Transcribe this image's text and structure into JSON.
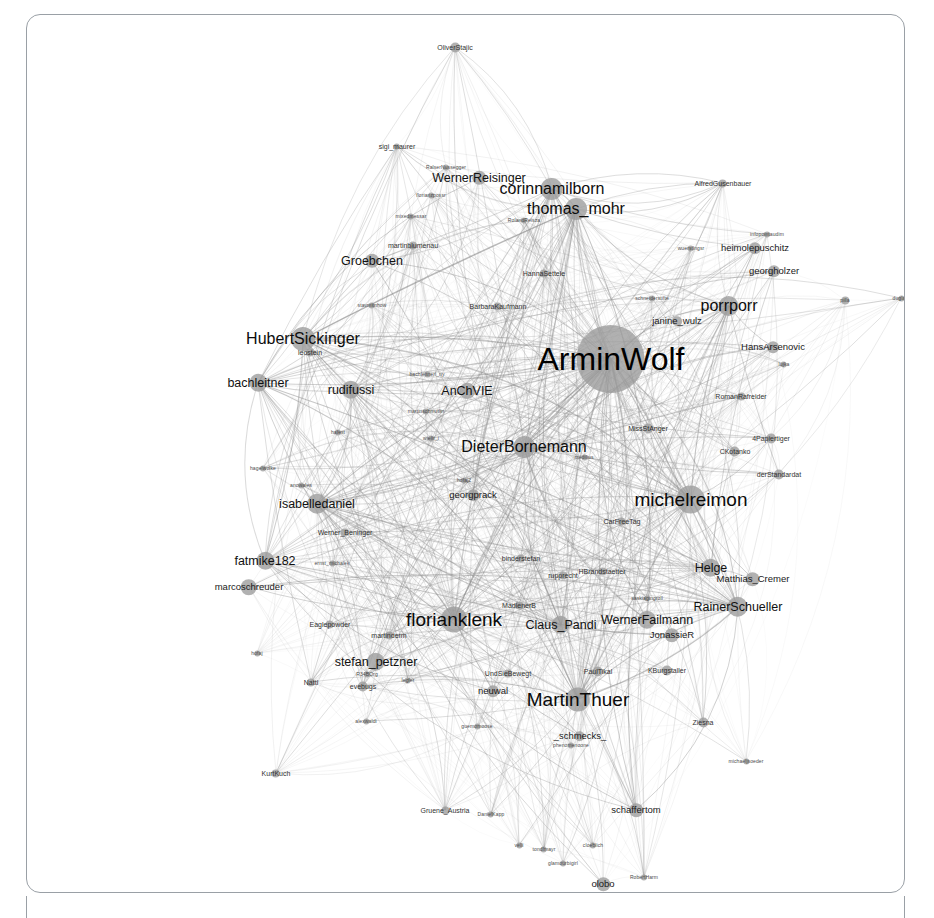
{
  "view": {
    "title": "Twitter mention network graph",
    "background_color": "#ffffff",
    "frame_color": "#9aa0a6",
    "node_color": "#9b9b9b",
    "edge_color": "#8d8d8d",
    "label_color": "#111111"
  },
  "chart_data": {
    "type": "scatter",
    "title": "",
    "xlabel": "",
    "ylabel": "",
    "layout": "force-directed node-link diagram",
    "grid": false,
    "legend": "none",
    "xlim": [
      0,
      877
    ],
    "ylim": [
      0,
      877
    ],
    "nodes": [
      {
        "label": "OliverStajic",
        "x": 428,
        "y": 32,
        "size": 5,
        "tier": "tier-s"
      },
      {
        "label": "sigi_maurer",
        "x": 370,
        "y": 131,
        "size": 3,
        "tier": "tier-s"
      },
      {
        "label": "RalserNussegger",
        "x": 419,
        "y": 152,
        "size": 3,
        "tier": "tier-xs"
      },
      {
        "label": "WernerReisinger",
        "x": 452,
        "y": 163,
        "size": 7,
        "tier": "tier-l"
      },
      {
        "label": "florianzpossr",
        "x": 404,
        "y": 180,
        "size": 3,
        "tier": "tier-xs"
      },
      {
        "label": "corinnamilborn",
        "x": 525,
        "y": 174,
        "size": 11,
        "tier": "tier-xl"
      },
      {
        "label": "thomas_mohr",
        "x": 549,
        "y": 194,
        "size": 11,
        "tier": "tier-xl"
      },
      {
        "label": "mixedmessar",
        "x": 384,
        "y": 201,
        "size": 3,
        "tier": "tier-xs"
      },
      {
        "label": "RolandReisza",
        "x": 497,
        "y": 205,
        "size": 3,
        "tier": "tier-xs"
      },
      {
        "label": "AlfredGusenbauer",
        "x": 696,
        "y": 168,
        "size": 4,
        "tier": "tier-s"
      },
      {
        "label": "martinblumenau",
        "x": 386,
        "y": 230,
        "size": 4,
        "tier": "tier-s"
      },
      {
        "label": "Groebchen",
        "x": 345,
        "y": 246,
        "size": 7,
        "tier": "tier-l"
      },
      {
        "label": "infopointaudim",
        "x": 740,
        "y": 219,
        "size": 3,
        "tier": "tier-xs"
      },
      {
        "label": "heimolepuschitz",
        "x": 728,
        "y": 233,
        "size": 6,
        "tier": "tier-m"
      },
      {
        "label": "georgholzer",
        "x": 747,
        "y": 256,
        "size": 6,
        "tier": "tier-m"
      },
      {
        "label": "wuerstlngsr",
        "x": 664,
        "y": 233,
        "size": 3,
        "tier": "tier-xs"
      },
      {
        "label": "HannaSettele",
        "x": 517,
        "y": 258,
        "size": 4,
        "tier": "tier-s"
      },
      {
        "label": "BarbaraKaufmann",
        "x": 471,
        "y": 291,
        "size": 4,
        "tier": "tier-s"
      },
      {
        "label": "schneiderstifte",
        "x": 625,
        "y": 283,
        "size": 3,
        "tier": "tier-xs"
      },
      {
        "label": "porrporr",
        "x": 702,
        "y": 291,
        "size": 10,
        "tier": "tier-xl"
      },
      {
        "label": "pilla",
        "x": 818,
        "y": 285,
        "size": 4,
        "tier": "tier-xs"
      },
      {
        "label": "duglam",
        "x": 874,
        "y": 283,
        "size": 3,
        "tier": "tier-xs"
      },
      {
        "label": "janine_wulz",
        "x": 650,
        "y": 306,
        "size": 5,
        "tier": "tier-m"
      },
      {
        "label": "ArminWolf",
        "x": 584,
        "y": 344,
        "size": 34,
        "tier": "tier-huge"
      },
      {
        "label": "HansArsenovic",
        "x": 746,
        "y": 332,
        "size": 6,
        "tier": "tier-m"
      },
      {
        "label": "lujka",
        "x": 757,
        "y": 349,
        "size": 3,
        "tier": "tier-xs"
      },
      {
        "label": "stavmitnhow",
        "x": 345,
        "y": 290,
        "size": 3,
        "tier": "tier-xs"
      },
      {
        "label": "HubertSickinger",
        "x": 276,
        "y": 324,
        "size": 12,
        "tier": "tier-xl"
      },
      {
        "label": "leostein",
        "x": 283,
        "y": 337,
        "size": 4,
        "tier": "tier-s"
      },
      {
        "label": "bachleitner",
        "x": 231,
        "y": 368,
        "size": 9,
        "tier": "tier-l"
      },
      {
        "label": "rudifussi",
        "x": 324,
        "y": 375,
        "size": 9,
        "tier": "tier-l"
      },
      {
        "label": "AnChVIE",
        "x": 440,
        "y": 376,
        "size": 8,
        "tier": "tier-l"
      },
      {
        "label": "bachleitneri_ny",
        "x": 400,
        "y": 359,
        "size": 3,
        "tier": "tier-xs"
      },
      {
        "label": "martinschmutlin",
        "x": 399,
        "y": 396,
        "size": 3,
        "tier": "tier-xs"
      },
      {
        "label": "RomanRafreider",
        "x": 714,
        "y": 381,
        "size": 4,
        "tier": "tier-s"
      },
      {
        "label": "MissStAnger",
        "x": 621,
        "y": 413,
        "size": 5,
        "tier": "tier-s"
      },
      {
        "label": "4Papiertiger",
        "x": 744,
        "y": 423,
        "size": 5,
        "tier": "tier-s"
      },
      {
        "label": "CKotanko",
        "x": 708,
        "y": 436,
        "size": 5,
        "tier": "tier-s"
      },
      {
        "label": "DieterBornemann",
        "x": 497,
        "y": 432,
        "size": 11,
        "tier": "tier-xl"
      },
      {
        "label": "medilius",
        "x": 557,
        "y": 442,
        "size": 3,
        "tier": "tier-xs"
      },
      {
        "label": "derStandardat",
        "x": 752,
        "y": 459,
        "size": 5,
        "tier": "tier-s"
      },
      {
        "label": "hafest",
        "x": 311,
        "y": 417,
        "size": 3,
        "tier": "tier-xs"
      },
      {
        "label": "wielir_i",
        "x": 404,
        "y": 423,
        "size": 3,
        "tier": "tier-xs"
      },
      {
        "label": "michelreimon",
        "x": 664,
        "y": 484,
        "size": 14,
        "tier": "tier-xxl"
      },
      {
        "label": "georgprack",
        "x": 446,
        "y": 480,
        "size": 6,
        "tier": "tier-m"
      },
      {
        "label": "hofaj2",
        "x": 437,
        "y": 465,
        "size": 3,
        "tier": "tier-xs"
      },
      {
        "label": "isabelledaniel",
        "x": 290,
        "y": 489,
        "size": 10,
        "tier": "tier-l"
      },
      {
        "label": "CarFreeTag",
        "x": 595,
        "y": 506,
        "size": 4,
        "tier": "tier-s"
      },
      {
        "label": "hagelwolke",
        "x": 236,
        "y": 453,
        "size": 3,
        "tier": "tier-xs"
      },
      {
        "label": "anowales",
        "x": 274,
        "y": 470,
        "size": 3,
        "tier": "tier-xs"
      },
      {
        "label": "Werner_Beninger",
        "x": 318,
        "y": 517,
        "size": 4,
        "tier": "tier-s"
      },
      {
        "label": "binderstefan",
        "x": 494,
        "y": 543,
        "size": 4,
        "tier": "tier-s"
      },
      {
        "label": "HBrandstaetter",
        "x": 575,
        "y": 556,
        "size": 4,
        "tier": "tier-s"
      },
      {
        "label": "rupprecht",
        "x": 536,
        "y": 560,
        "size": 4,
        "tier": "tier-s"
      },
      {
        "label": "fatmike182",
        "x": 238,
        "y": 546,
        "size": 9,
        "tier": "tier-l"
      },
      {
        "label": "ernst_michalek",
        "x": 305,
        "y": 548,
        "size": 3,
        "tier": "tier-xs"
      },
      {
        "label": "marcoschreuder",
        "x": 222,
        "y": 572,
        "size": 8,
        "tier": "tier-m"
      },
      {
        "label": "Helge",
        "x": 684,
        "y": 553,
        "size": 9,
        "tier": "tier-l"
      },
      {
        "label": "Matthias_Cremer",
        "x": 726,
        "y": 564,
        "size": 7,
        "tier": "tier-m"
      },
      {
        "label": "saskiagingroll",
        "x": 620,
        "y": 583,
        "size": 3,
        "tier": "tier-xs"
      },
      {
        "label": "RainerSchueller",
        "x": 711,
        "y": 592,
        "size": 10,
        "tier": "tier-l"
      },
      {
        "label": "MadlenerB",
        "x": 492,
        "y": 590,
        "size": 4,
        "tier": "tier-s"
      },
      {
        "label": "florianklenk",
        "x": 427,
        "y": 604,
        "size": 13,
        "tier": "tier-xxl"
      },
      {
        "label": "Claus_Pandi",
        "x": 534,
        "y": 610,
        "size": 9,
        "tier": "tier-l"
      },
      {
        "label": "WernerFailmann",
        "x": 620,
        "y": 605,
        "size": 9,
        "tier": "tier-l"
      },
      {
        "label": "JonassieR",
        "x": 645,
        "y": 620,
        "size": 7,
        "tier": "tier-m"
      },
      {
        "label": "Eaglepowder",
        "x": 303,
        "y": 609,
        "size": 4,
        "tier": "tier-s"
      },
      {
        "label": "martinderm",
        "x": 362,
        "y": 620,
        "size": 4,
        "tier": "tier-s"
      },
      {
        "label": "hofaj",
        "x": 230,
        "y": 638,
        "size": 3,
        "tier": "tier-xs"
      },
      {
        "label": "stefan_petzner",
        "x": 349,
        "y": 647,
        "size": 9,
        "tier": "tier-l"
      },
      {
        "label": "R34BOrg",
        "x": 340,
        "y": 659,
        "size": 3,
        "tier": "tier-xs"
      },
      {
        "label": "Nattl",
        "x": 284,
        "y": 667,
        "size": 4,
        "tier": "tier-s"
      },
      {
        "label": "evebugs",
        "x": 336,
        "y": 671,
        "size": 5,
        "tier": "tier-s"
      },
      {
        "label": "legler",
        "x": 381,
        "y": 665,
        "size": 3,
        "tier": "tier-xs"
      },
      {
        "label": "PaulTikal",
        "x": 571,
        "y": 656,
        "size": 5,
        "tier": "tier-s"
      },
      {
        "label": "KBurgstaller",
        "x": 640,
        "y": 655,
        "size": 5,
        "tier": "tier-s"
      },
      {
        "label": "UndSieBewegt",
        "x": 481,
        "y": 658,
        "size": 4,
        "tier": "tier-s"
      },
      {
        "label": "neuwal",
        "x": 466,
        "y": 676,
        "size": 6,
        "tier": "tier-m"
      },
      {
        "label": "MartinThuer",
        "x": 551,
        "y": 684,
        "size": 12,
        "tier": "tier-xxl"
      },
      {
        "label": "alexwaldi",
        "x": 339,
        "y": 706,
        "size": 3,
        "tier": "tier-xs"
      },
      {
        "label": "guemomoose",
        "x": 450,
        "y": 711,
        "size": 3,
        "tier": "tier-xs"
      },
      {
        "label": "_schmecks_",
        "x": 553,
        "y": 721,
        "size": 5,
        "tier": "tier-m"
      },
      {
        "label": "phenomenoone",
        "x": 544,
        "y": 730,
        "size": 3,
        "tier": "tier-xs"
      },
      {
        "label": "Ziesna",
        "x": 676,
        "y": 707,
        "size": 5,
        "tier": "tier-s"
      },
      {
        "label": "michaeljsoeder",
        "x": 719,
        "y": 746,
        "size": 3,
        "tier": "tier-xs"
      },
      {
        "label": "KurtKuch",
        "x": 249,
        "y": 758,
        "size": 4,
        "tier": "tier-s"
      },
      {
        "label": "Gruene_Austria",
        "x": 418,
        "y": 795,
        "size": 4,
        "tier": "tier-s"
      },
      {
        "label": "DanielKapp",
        "x": 464,
        "y": 799,
        "size": 3,
        "tier": "tier-xs"
      },
      {
        "label": "schaffertom",
        "x": 609,
        "y": 795,
        "size": 7,
        "tier": "tier-m"
      },
      {
        "label": "glamourbigirl",
        "x": 536,
        "y": 848,
        "size": 3,
        "tier": "tier-xs"
      },
      {
        "label": "olobo",
        "x": 576,
        "y": 869,
        "size": 7,
        "tier": "tier-m"
      },
      {
        "label": "RobertHarm",
        "x": 617,
        "y": 862,
        "size": 3,
        "tier": "tier-xs"
      },
      {
        "label": "tondlmayr",
        "x": 517,
        "y": 834,
        "size": 3,
        "tier": "tier-xs"
      },
      {
        "label": "cloeblich",
        "x": 566,
        "y": 830,
        "size": 3,
        "tier": "tier-xs"
      },
      {
        "label": "velli",
        "x": 492,
        "y": 830,
        "size": 3,
        "tier": "tier-xs"
      }
    ]
  }
}
